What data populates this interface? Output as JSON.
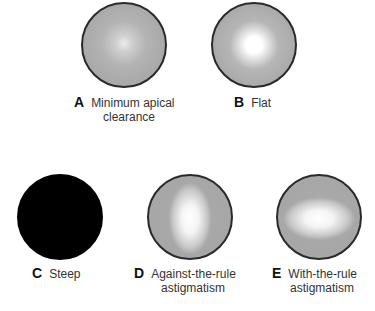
{
  "figure": {
    "panels": [
      {
        "letter": "A",
        "label_line1": "Minimum apical",
        "label_line2": "clearance",
        "pattern": "minimum-apical-clearance"
      },
      {
        "letter": "B",
        "label_line1": "Flat",
        "label_line2": "",
        "pattern": "flat"
      },
      {
        "letter": "C",
        "label_line1": "Steep",
        "label_line2": "",
        "pattern": "steep"
      },
      {
        "letter": "D",
        "label_line1": "Against-the-rule",
        "label_line2": "astigmatism",
        "pattern": "against-the-rule-astigmatism"
      },
      {
        "letter": "E",
        "label_line1": "With-the-rule",
        "label_line2": "astigmatism",
        "pattern": "with-the-rule-astigmatism"
      }
    ]
  }
}
